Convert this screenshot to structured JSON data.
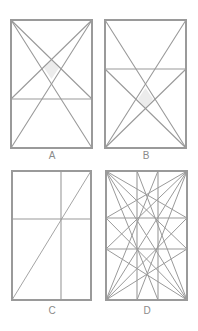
{
  "figure": {
    "stroke_color": "#9a9a9a",
    "shade_color": "#ececec",
    "panels": [
      {
        "id": "A",
        "label": "A",
        "description": "Rectangle with two diagonals, a horizontal line near the bottom, and lines from top corners to the ends of the horizontal line; shaded diamond at center-top"
      },
      {
        "id": "B",
        "label": "B",
        "description": "Rectangle with two diagonals, a horizontal line near the top, and lines from bottom corners to the ends of the horizontal line; shaded diamond at center-bottom"
      },
      {
        "id": "C",
        "label": "C",
        "description": "Rectangle with one diagonal (bottom-left to top-right), one vertical and one horizontal line meeting on the diagonal"
      },
      {
        "id": "D",
        "label": "D",
        "description": "Rectangle divided into thirds by two vertical and two horizontal lines, with lines fanning from each corner to the third-points of opposite sides"
      }
    ]
  }
}
